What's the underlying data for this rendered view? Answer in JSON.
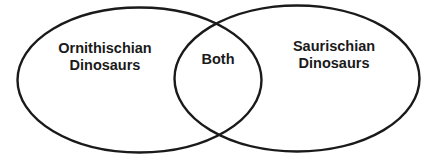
{
  "diagram": {
    "type": "venn",
    "sets": [
      {
        "label_line1": "Ornithischian",
        "label_line2": "Dinosaurs"
      },
      {
        "label_line1": "Saurischian",
        "label_line2": "Dinosaurs"
      }
    ],
    "intersection": {
      "label": "Both"
    },
    "stroke_color": "#1a1a1a",
    "background": "#ffffff"
  }
}
